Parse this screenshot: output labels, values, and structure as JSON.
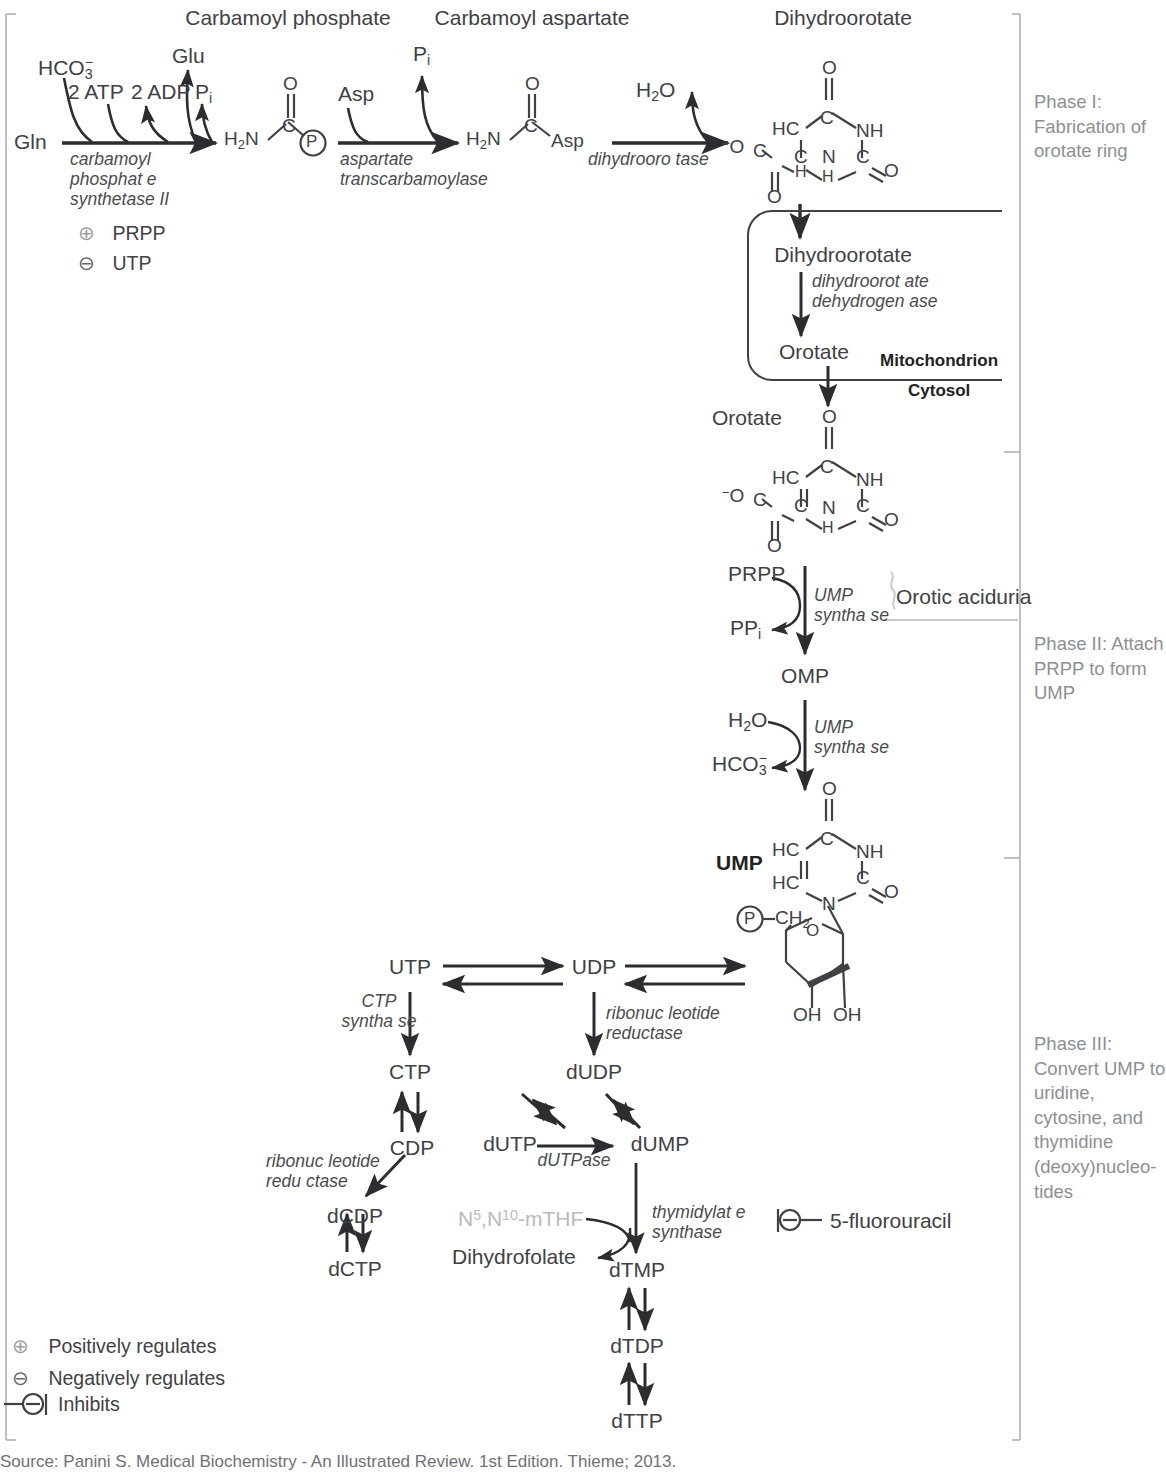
{
  "figure": {
    "source": "Source: Panini S. Medical Biochemistry - An Illustrated Review. 1st Edition. Thieme; 2013."
  },
  "phases": [
    {
      "id": "phase-1",
      "text": "Phase I: Fabrication of orotate ring"
    },
    {
      "id": "phase-2",
      "text": "Phase II: Attach PRPP to form UMP"
    },
    {
      "id": "phase-3",
      "text": "Phase III: Convert UMP to uridine, cytosine, and thymidine (deoxy)nucleo-tides"
    }
  ],
  "compound_titles": {
    "carbamoyl_phosphate": "Carbamoyl phosphate",
    "carbamoyl_aspartate": "Carbamoyl aspartate",
    "dihydroorotate": "Dihydroorotate"
  },
  "substrates": {
    "gln": "Gln",
    "hco3": "HCO3",
    "hco3_charge": "−",
    "hco3_num": "3",
    "atp": "2 ATP",
    "adp": "2 ADP",
    "glu": "Glu",
    "pi": "Pi",
    "asp": "Asp",
    "h2o": "H2O",
    "prpp": "PRPP",
    "ppi": "PPi"
  },
  "enzymes": {
    "cps2": "carbamoyl phosphate synthetase II",
    "atcase": "aspartate transcarbamoylase",
    "dhoase": "dihydroorotase",
    "dhodh": "dihydroorotate dehydrogenase",
    "ump_synthase": "UMP synthase",
    "ctp_synthase": "CTP synthase",
    "rnr": "ribonucleotide reductase",
    "dutpase": "dUTPase",
    "ts": "thymidylate synthase"
  },
  "regulators": [
    {
      "symbol": "⊕",
      "label": "PRPP",
      "name": "prpp-activator"
    },
    {
      "symbol": "⊖",
      "label": "UTP",
      "name": "utp-inhibitor"
    }
  ],
  "compartments": {
    "mitochondrion": "Mitochondrion",
    "cytosol": "Cytosol"
  },
  "metabolites": {
    "dihydroorotate_mito": "Dihydroorotate",
    "orotate_mito": "Orotate",
    "orotate_cyto": "Orotate",
    "omp": "OMP",
    "ump": "UMP",
    "utp": "UTP",
    "udp": "UDP",
    "ctp": "CTP",
    "cdp": "CDP",
    "dcdp": "dCDP",
    "dctp": "dCTP",
    "dudp": "dUDP",
    "dutp": "dUTP",
    "dump": "dUMP",
    "dtmp": "dTMP",
    "dtdp": "dTDP",
    "dttp": "dTTP",
    "dihydrofolate": "Dihydrofolate",
    "mthf": "N5,N10-mTHF"
  },
  "disease": {
    "orotic_aciduria": "Orotic aciduria"
  },
  "drugs": {
    "fluorouracil": "5-fluorouracil"
  },
  "legend": [
    {
      "symbol": "⊕",
      "label": "Positively regulates",
      "name": "legend-positively-regulates"
    },
    {
      "symbol": "⊖",
      "label": "Negatively regulates",
      "name": "legend-negatively-regulates"
    },
    {
      "symbol": "⊖",
      "label": "Inhibits",
      "name": "legend-inhibits"
    }
  ],
  "structures": {
    "carbamoyl_phosphate": {
      "n": "H2N",
      "c": "C",
      "o": "O",
      "p": "P"
    },
    "carbamoyl_aspartate": {
      "n": "H2N",
      "c": "C",
      "o": "O",
      "asp": "Asp"
    },
    "ring": {
      "hc": "HC",
      "nh": "NH",
      "c": "C",
      "o": "O",
      "n": "N",
      "h": "H",
      "minus_o": "−O"
    },
    "ribose": {
      "ch2": "CH2",
      "o": "O",
      "oh_left": "OH",
      "oh_right": "OH",
      "p": "P"
    }
  },
  "colors": {
    "ink": "#3f4145",
    "muted": "#8d8f93",
    "faded": "#b9babd",
    "line": "#2b2d30"
  }
}
